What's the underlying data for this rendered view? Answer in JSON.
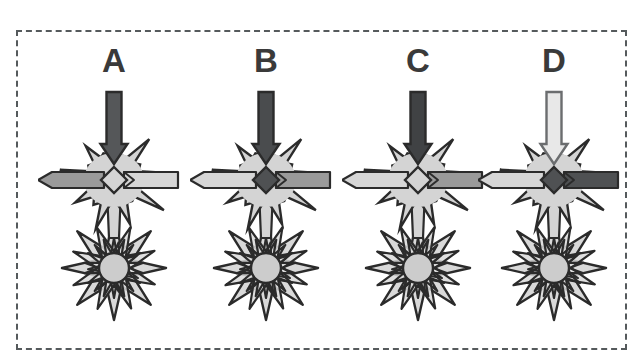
{
  "figure": {
    "border_style": "dashed",
    "border_color": "#555a5c",
    "background": "#ffffff"
  },
  "palette": {
    "outline": "#2b2b2b",
    "star_fill_light": "#d4d4d4",
    "cluster_fill": "#d9d9d9",
    "circle_fill": "#cccccc",
    "bar_light": "#d6d6d6",
    "bar_medium": "#9a9a9a",
    "bar_dark": "#4f5153",
    "diamond_light": "#d4d4d4",
    "diamond_dark": "#4f5153",
    "arrow_dark": "#555759",
    "arrow_darker": "#3f4143",
    "arrow_light": "#e2e2e2",
    "label_color": "#3a3a3a"
  },
  "panels": [
    {
      "id": "A",
      "label": "A",
      "arrow_fill": "#555759",
      "arrow_stroke": "#2b2b2b",
      "left_bar_fill": "#9a9a9a",
      "right_bar_fill": "#d6d6d6",
      "diamond_fill": "#d4d4d4",
      "star_fill": "#d4d4d4",
      "cluster_fill": "#d9d9d9"
    },
    {
      "id": "B",
      "label": "B",
      "arrow_fill": "#4a4c4e",
      "arrow_stroke": "#2b2b2b",
      "left_bar_fill": "#d6d6d6",
      "right_bar_fill": "#9a9a9a",
      "diamond_fill": "#4f5153",
      "star_fill": "#d4d4d4",
      "cluster_fill": "#d9d9d9"
    },
    {
      "id": "C",
      "label": "C",
      "arrow_fill": "#404244",
      "arrow_stroke": "#2b2b2b",
      "left_bar_fill": "#d6d6d6",
      "right_bar_fill": "#9a9a9a",
      "diamond_fill": "#d4d4d4",
      "star_fill": "#d4d4d4",
      "cluster_fill": "#d9d9d9"
    },
    {
      "id": "D",
      "label": "D",
      "arrow_fill": "#e8e8e8",
      "arrow_stroke": "#6b6d6f",
      "left_bar_fill": "#d6d6d6",
      "right_bar_fill": "#4f5153",
      "diamond_fill": "#4f5153",
      "star_fill": "#d4d4d4",
      "cluster_fill": "#d9d9d9"
    }
  ]
}
